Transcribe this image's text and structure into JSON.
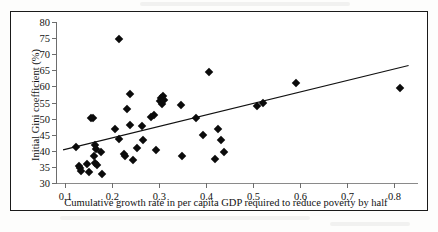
{
  "figure": {
    "frame_border_color": "#1a1a1a",
    "background_color": "#ffffff",
    "marker_color": "#0b0b0b",
    "trendline_color": "#111111"
  },
  "chart_data": {
    "type": "scatter",
    "title": "",
    "subtitle": "",
    "xlabel": "Cumulative growth rate in per capita GDP required to reduce poverty by half",
    "ylabel": "Initial Gini coefficient (%)",
    "xlim": [
      0.08,
      0.85
    ],
    "ylim": [
      30,
      80
    ],
    "xticks": [
      0.1,
      0.2,
      0.3,
      0.4,
      0.5,
      0.6,
      0.7,
      0.8
    ],
    "xtick_labels": [
      "0.1",
      "0.2",
      "0.3",
      "0.4",
      "0.5",
      "0.6",
      "0.7",
      "0.8"
    ],
    "yticks": [
      30,
      35,
      40,
      45,
      50,
      55,
      60,
      65,
      70,
      75,
      80
    ],
    "ytick_labels": [
      "30",
      "35",
      "40",
      "45",
      "50",
      "55",
      "60",
      "65",
      "70",
      "75",
      "80"
    ],
    "grid": false,
    "legend": null,
    "marker": "filled-diamond",
    "points": [
      {
        "x": 0.123,
        "y": 41.3
      },
      {
        "x": 0.128,
        "y": 35.3
      },
      {
        "x": 0.131,
        "y": 34.8
      },
      {
        "x": 0.133,
        "y": 33.6
      },
      {
        "x": 0.145,
        "y": 36.0
      },
      {
        "x": 0.15,
        "y": 33.3
      },
      {
        "x": 0.155,
        "y": 50.3
      },
      {
        "x": 0.158,
        "y": 50.1
      },
      {
        "x": 0.16,
        "y": 38.4
      },
      {
        "x": 0.162,
        "y": 36.2
      },
      {
        "x": 0.163,
        "y": 41.8
      },
      {
        "x": 0.165,
        "y": 40.6
      },
      {
        "x": 0.168,
        "y": 35.5
      },
      {
        "x": 0.176,
        "y": 39.6
      },
      {
        "x": 0.178,
        "y": 32.7
      },
      {
        "x": 0.205,
        "y": 46.8
      },
      {
        "x": 0.213,
        "y": 74.6
      },
      {
        "x": 0.215,
        "y": 43.7
      },
      {
        "x": 0.224,
        "y": 39.1
      },
      {
        "x": 0.226,
        "y": 38.4
      },
      {
        "x": 0.232,
        "y": 52.9
      },
      {
        "x": 0.237,
        "y": 48.1
      },
      {
        "x": 0.238,
        "y": 57.6
      },
      {
        "x": 0.243,
        "y": 37.1
      },
      {
        "x": 0.252,
        "y": 41.0
      },
      {
        "x": 0.262,
        "y": 47.8
      },
      {
        "x": 0.266,
        "y": 43.4
      },
      {
        "x": 0.283,
        "y": 50.4
      },
      {
        "x": 0.288,
        "y": 51.1
      },
      {
        "x": 0.292,
        "y": 40.2
      },
      {
        "x": 0.302,
        "y": 55.4
      },
      {
        "x": 0.304,
        "y": 56.3
      },
      {
        "x": 0.306,
        "y": 54.6
      },
      {
        "x": 0.308,
        "y": 57.0
      },
      {
        "x": 0.31,
        "y": 55.9
      },
      {
        "x": 0.345,
        "y": 54.3
      },
      {
        "x": 0.348,
        "y": 38.3
      },
      {
        "x": 0.378,
        "y": 50.2
      },
      {
        "x": 0.392,
        "y": 45.0
      },
      {
        "x": 0.405,
        "y": 64.4
      },
      {
        "x": 0.418,
        "y": 37.6
      },
      {
        "x": 0.425,
        "y": 46.8
      },
      {
        "x": 0.432,
        "y": 43.2
      },
      {
        "x": 0.437,
        "y": 39.6
      },
      {
        "x": 0.508,
        "y": 54.0
      },
      {
        "x": 0.52,
        "y": 54.9
      },
      {
        "x": 0.59,
        "y": 61.2
      },
      {
        "x": 0.812,
        "y": 59.4
      }
    ],
    "trendline": {
      "type": "linear-fit",
      "x_start": 0.095,
      "y_start": 40.3,
      "x_end": 0.83,
      "y_end": 66.5
    }
  }
}
